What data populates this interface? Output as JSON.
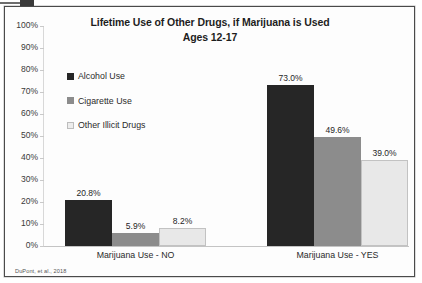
{
  "figure": {
    "source_note": "DuPont, et al., 2018"
  },
  "chart_data": {
    "type": "bar",
    "title": "Lifetime Use of Other Drugs, if Marijuana is Used",
    "subtitle": "Ages 12-17",
    "xlabel": "",
    "ylabel": "",
    "ylim": [
      0,
      100
    ],
    "grid": false,
    "legend_position": "inside-upper-left",
    "categories": [
      "Marijuana Use - NO",
      "Marijuana Use - YES"
    ],
    "ytick_labels": [
      "0%",
      "10%",
      "20%",
      "30%",
      "40%",
      "50%",
      "60%",
      "70%",
      "80%",
      "90%",
      "100%"
    ],
    "ytick_values": [
      0,
      10,
      20,
      30,
      40,
      50,
      60,
      70,
      80,
      90,
      100
    ],
    "series": [
      {
        "name": "Alcohol Use",
        "color": "#262626",
        "values": [
          20.8,
          73.0
        ],
        "labels": [
          "20.8%",
          "73.0%"
        ]
      },
      {
        "name": "Cigarette Use",
        "color": "#8C8C8C",
        "values": [
          5.9,
          49.6
        ],
        "labels": [
          "5.9%",
          "49.6%"
        ]
      },
      {
        "name": "Other Illicit Drugs",
        "color": "#E8E8E8",
        "values": [
          8.2,
          39.0
        ],
        "labels": [
          "8.2%",
          "39.0%"
        ]
      }
    ]
  }
}
